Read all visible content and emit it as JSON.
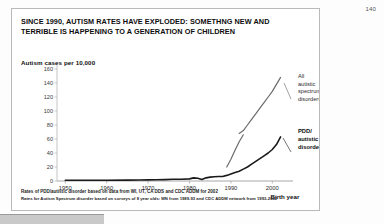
{
  "page_number": "140",
  "slide": {
    "title": "SINCE 1990, AUTISM RATES HAVE EXPLODED: SOMETHNG NEW AND TERRIBLE IS HAPPENING TO A GENERATION OF CHILDREN",
    "footnote_line_1": "Rates of PDD/autistic disorder based on data from WI, UT, CA DDS and CDC ADDM for 2002",
    "footnote_line_2": "Rates for Autism Spectrum disorder based on surveys of 8 year olds: MN from 1989-93 and CDC ADDM network from 1993-2002"
  },
  "chart_data": {
    "type": "line",
    "title": "Autism cases per 10,000",
    "xlabel": "Birth year",
    "ylabel": "Autism cases per 10,000",
    "xlim": [
      1948,
      2005
    ],
    "ylim": [
      0,
      160
    ],
    "grid": false,
    "legend_position": "inline-right-annotations",
    "xticks": [
      "1950",
      "1960",
      "1970",
      "1980",
      "1990",
      "2000"
    ],
    "xtick_values": [
      1950,
      1960,
      1970,
      1980,
      1990,
      2000
    ],
    "yticks": [
      "0",
      "20",
      "40",
      "60",
      "80",
      "100",
      "120",
      "140",
      "160"
    ],
    "ytick_values": [
      0,
      20,
      40,
      60,
      80,
      100,
      120,
      140,
      160
    ],
    "series": [
      {
        "name": "PDD/ autistic disorder",
        "label_lines": [
          "PDD/",
          "autistic",
          "disorder"
        ],
        "color": "#1a1a1a",
        "width": 1.6,
        "x": [
          1950,
          1955,
          1960,
          1965,
          1968,
          1970,
          1972,
          1974,
          1976,
          1978,
          1980,
          1981,
          1982,
          1983,
          1984,
          1985,
          1986,
          1987,
          1988,
          1989,
          1990,
          1991,
          1992,
          1993,
          1994,
          1995,
          1996,
          1997,
          1998,
          1999,
          2000,
          2001,
          2002
        ],
        "y": [
          1,
          1,
          1,
          1.2,
          1.5,
          1.6,
          1.8,
          2,
          2.4,
          2.6,
          3,
          4.5,
          4,
          2.2,
          4.5,
          5.5,
          6,
          6.5,
          6.5,
          8,
          10,
          12,
          14,
          17,
          20,
          24,
          28,
          32,
          36,
          40,
          45,
          52,
          63
        ]
      },
      {
        "name": "All autistic spectrum disorders",
        "label_lines": [
          "All",
          "autistic",
          "spectrum",
          "disorders"
        ],
        "color": "#6b6b6b",
        "width": 1.2,
        "segments": [
          {
            "x": [
              1989,
              1990,
              1991,
              1992,
              1993
            ],
            "y": [
              20,
              31,
              44,
              56,
              66
            ]
          },
          {
            "x": [
              1992,
              1993,
              1994,
              1995,
              1996,
              1997,
              1998,
              1999,
              2000,
              2001,
              2002
            ],
            "y": [
              68,
              72,
              80,
              88,
              96,
              104,
              112,
              120,
              128,
              138,
              148
            ]
          }
        ]
      }
    ]
  }
}
